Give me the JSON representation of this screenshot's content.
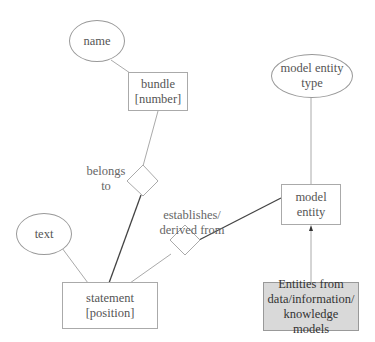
{
  "diagram": {
    "type": "entity-relationship",
    "entities": {
      "bundle": {
        "line1": "bundle",
        "line2": "[number]"
      },
      "statement": {
        "line1": "statement",
        "line2": "[position]"
      },
      "model_entity": {
        "line1": "model",
        "line2": "entity"
      },
      "external": {
        "line1": "Entities from",
        "line2": "data/information/",
        "line3": "knowledge models"
      }
    },
    "attributes": {
      "name": "name",
      "text": "text",
      "model_entity_type": {
        "line1": "model entity",
        "line2": "type"
      }
    },
    "relationships": {
      "belongs_to": {
        "line1": "belongs",
        "line2": "to"
      },
      "establishes": {
        "line1": "establishes/",
        "line2": "derived from"
      }
    },
    "colors": {
      "line": "#aaaaaa",
      "strong_line": "#444444",
      "external_fill": "#d9d9d9"
    }
  }
}
